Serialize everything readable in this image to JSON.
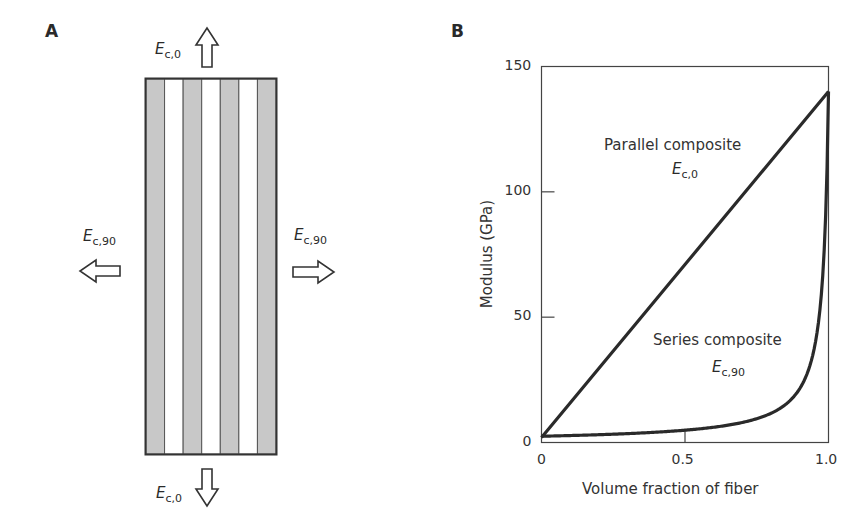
{
  "panel_a": {
    "label": "A",
    "stripes": [
      "fiber",
      "matrix",
      "fiber",
      "matrix",
      "fiber",
      "matrix",
      "fiber"
    ],
    "fiber_color": "#c8c8c8",
    "matrix_color": "#ffffff",
    "arrows": {
      "top": {
        "symbol": "E",
        "sub": "c,0",
        "direction": "up"
      },
      "bottom": {
        "symbol": "E",
        "sub": "c,0",
        "direction": "down"
      },
      "left": {
        "symbol": "E",
        "sub": "c,90",
        "direction": "left"
      },
      "right": {
        "symbol": "E",
        "sub": "c,90",
        "direction": "right"
      }
    }
  },
  "panel_b": {
    "label": "B"
  },
  "chart_data": {
    "type": "line",
    "title": "",
    "xlabel": "Volume fraction of fiber",
    "ylabel": "Modulus (GPa)",
    "xlim": [
      0,
      1.0
    ],
    "ylim": [
      0,
      150
    ],
    "xticks": [
      "0",
      "0.5",
      "1.0"
    ],
    "yticks": [
      "0",
      "50",
      "100",
      "150"
    ],
    "grid": false,
    "legend": "none (inline annotations)",
    "series": [
      {
        "name": "Parallel composite",
        "label_symbol": "E",
        "label_sub": "c,0",
        "x": [
          0,
          0.25,
          0.5,
          0.75,
          1.0
        ],
        "values": [
          2,
          36.5,
          71,
          105.5,
          140
        ]
      },
      {
        "name": "Series composite",
        "label_symbol": "E",
        "label_sub": "c,90",
        "x": [
          0,
          0.2,
          0.4,
          0.5,
          0.6,
          0.7,
          0.8,
          0.85,
          0.9,
          0.95,
          0.98,
          1.0
        ],
        "values": [
          2.5,
          3.1,
          4.1,
          4.9,
          6.1,
          8.1,
          12,
          15.8,
          23,
          42,
          80,
          140
        ]
      }
    ],
    "annotations": [
      {
        "text": "Parallel composite",
        "sub_label": "Ec,0"
      },
      {
        "text": "Series composite",
        "sub_label": "Ec,90"
      }
    ]
  }
}
